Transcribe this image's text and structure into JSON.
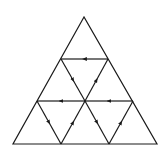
{
  "diagram": {
    "type": "triangular-grid-with-directed-edges",
    "stroke_color": "#1a1a1a",
    "background": "#ffffff",
    "outer_triangle": {
      "apex": [
        84,
        17
      ],
      "bottom_left": [
        13,
        144
      ],
      "bottom_right": [
        157,
        144
      ]
    },
    "directed_edges": [
      {
        "from": [
          108,
          59
        ],
        "to": [
          61,
          59
        ],
        "direction": "left"
      },
      {
        "from": [
          61,
          59
        ],
        "to": [
          85,
          101
        ],
        "direction": "down-right"
      },
      {
        "from": [
          85,
          101
        ],
        "to": [
          108,
          59
        ],
        "direction": "up-right"
      },
      {
        "from": [
          85,
          101
        ],
        "to": [
          37,
          101
        ],
        "direction": "left"
      },
      {
        "from": [
          133,
          101
        ],
        "to": [
          85,
          101
        ],
        "direction": "left"
      },
      {
        "from": [
          37,
          101
        ],
        "to": [
          61,
          144
        ],
        "direction": "down-right"
      },
      {
        "from": [
          61,
          144
        ],
        "to": [
          85,
          101
        ],
        "direction": "up-right"
      },
      {
        "from": [
          85,
          101
        ],
        "to": [
          109,
          144
        ],
        "direction": "down-right"
      },
      {
        "from": [
          109,
          144
        ],
        "to": [
          133,
          101
        ],
        "direction": "up-right"
      }
    ]
  }
}
